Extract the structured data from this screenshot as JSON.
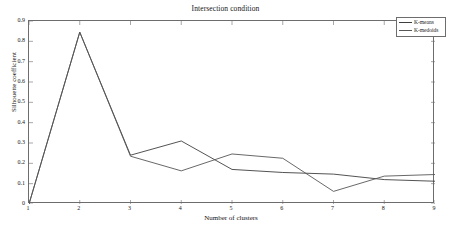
{
  "chart_data": {
    "type": "line",
    "title": "Intersection condition",
    "xlabel": "Number of clusters",
    "ylabel": "Silhouette coefficient",
    "x": [
      1,
      2,
      3,
      4,
      5,
      6,
      7,
      8,
      9
    ],
    "xlim": [
      1,
      9
    ],
    "ylim": [
      0,
      0.9
    ],
    "grid": false,
    "legend_position": "top-right",
    "xticks": [
      "1",
      "2",
      "3",
      "4",
      "5",
      "6",
      "7",
      "8",
      "9"
    ],
    "yticks": [
      "0",
      "0.1",
      "0.2",
      "0.3",
      "0.4",
      "0.5",
      "0.6",
      "0.7",
      "0.8",
      "0.9"
    ],
    "series": [
      {
        "name": "K-means",
        "color": "#3f3f3f",
        "values": [
          0.0,
          0.845,
          0.24,
          0.31,
          0.17,
          0.155,
          0.147,
          0.12,
          0.112
        ]
      },
      {
        "name": "K-medoids",
        "color": "#575757",
        "values": [
          0.0,
          0.845,
          0.235,
          0.163,
          0.246,
          0.225,
          0.062,
          0.137,
          0.145
        ]
      }
    ]
  },
  "legend": {
    "entries": [
      {
        "label": "K-means"
      },
      {
        "label": "K-medoids"
      }
    ]
  }
}
